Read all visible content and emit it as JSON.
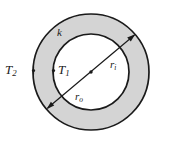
{
  "figure": {
    "type": "annulus-cross-section-diagram",
    "background_color": "#ffffff",
    "shell_fill_color": "#d4d4d4",
    "stroke_color": "#1a1a1a",
    "geometry": {
      "center_x": 91,
      "center_y": 72,
      "outer_radius": 58,
      "inner_radius": 38,
      "outer_stroke_width": 1.6,
      "inner_stroke_width": 1.6
    },
    "diameter_line": {
      "label": "diameter-with-arrows",
      "angle_degrees": -40,
      "arrow_outer_end": "lower-left",
      "arrow_inner_end": "upper-right",
      "center_dot": true
    },
    "labels": {
      "conductivity": "k",
      "outer_temperature": "T",
      "outer_temperature_sub": "2",
      "inner_temperature": "T",
      "inner_temperature_sub": "1",
      "inner_radius": "r",
      "inner_radius_sub": "i",
      "outer_radius": "r",
      "outer_radius_sub": "o"
    },
    "markers": {
      "outer_tick_label": "T2 tick on outer circle",
      "inner_tick_label": "T1 tick on inner circle"
    }
  }
}
